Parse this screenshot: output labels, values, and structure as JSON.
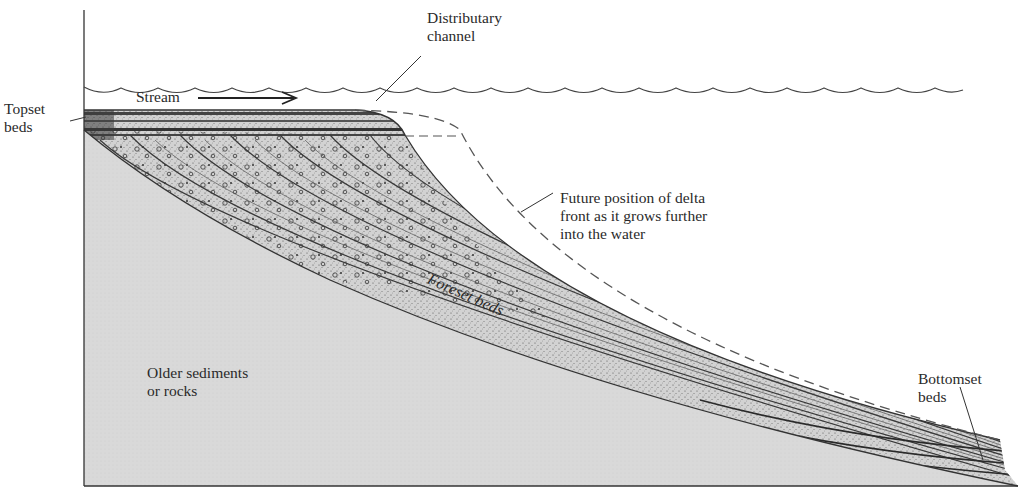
{
  "figure": {
    "colors": {
      "background": "#ffffff",
      "line": "#333333",
      "older_sediments_fill": "#d6d6d6",
      "delta_fill": "#c9c9c9",
      "dashed_line": "#555555"
    }
  },
  "labels": {
    "topset": [
      "Topset",
      "beds"
    ],
    "stream": "Stream",
    "distributary": [
      "Distributary",
      "channel"
    ],
    "future_front": [
      "Future position of delta",
      "front as it grows further",
      "into the water"
    ],
    "foreset": "Foreset beds",
    "older": [
      "Older sediments",
      "or rocks"
    ],
    "bottomset": [
      "Bottomset",
      "beds"
    ]
  },
  "elements": {
    "water_surface": "wavy line",
    "stream_arrow": "right-arrow",
    "future_front_line": "dashed curve"
  }
}
